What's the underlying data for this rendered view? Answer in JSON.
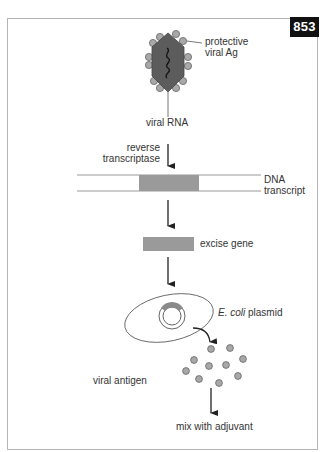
{
  "figure": {
    "badge": "853",
    "colors": {
      "frame": "#b5b5b5",
      "badge_bg": "#111111",
      "virus_body": "#5c5c5c",
      "antigen_dot": "#a8a8a8",
      "gene_block": "#9a9a9a",
      "line": "#333333"
    }
  },
  "labels": {
    "protective_line1": "protective",
    "protective_line2": "viral Ag",
    "viral_rna": "viral RNA",
    "reverse_line1": "reverse",
    "reverse_line2": "transcriptase",
    "dna_line1": "DNA",
    "dna_line2": "transcript",
    "excise_gene": "excise gene",
    "ecoli_italic": "E. coli",
    "ecoli_rest": " plasmid",
    "viral_antigen": "viral antigen",
    "mix": "mix with adjuvant"
  }
}
